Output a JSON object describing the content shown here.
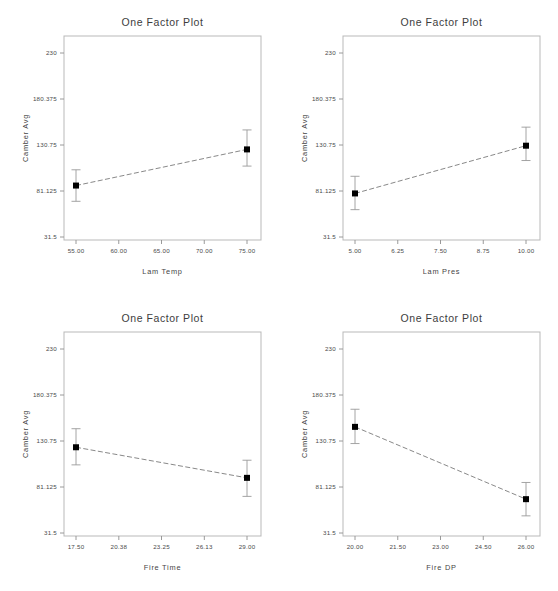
{
  "figure": {
    "background_color": "#ffffff",
    "panel_count": 4,
    "shared_title": "One Factor Plot",
    "shared_ylabel": "Camber Avg",
    "marker_color": "#000000",
    "line_color": "#7a7a7a",
    "frame_color": "#b9b9b9"
  },
  "chart_data": [
    {
      "type": "line",
      "title": "One Factor Plot",
      "xlabel": "Lam Temp",
      "ylabel": "Camber Avg",
      "xlim": [
        55.0,
        75.0
      ],
      "ylim": [
        31.5,
        230.0
      ],
      "xticks": [
        "55.00",
        "60.00",
        "65.00",
        "70.00",
        "75.00"
      ],
      "yticks": [
        "230",
        "180.375",
        "130.75",
        "81.125",
        "31.5"
      ],
      "grid": false,
      "legend": "none",
      "x": [
        55.0,
        75.0
      ],
      "values": [
        87.0,
        126.0
      ],
      "error_low": [
        70.0,
        108.0
      ],
      "error_high": [
        104.0,
        147.0
      ]
    },
    {
      "type": "line",
      "title": "One Factor Plot",
      "xlabel": "Lam Pres",
      "ylabel": "Camber Avg",
      "xlim": [
        5.0,
        10.0
      ],
      "ylim": [
        31.5,
        230.0
      ],
      "xticks": [
        "5.00",
        "6.25",
        "7.50",
        "8.75",
        "10.00"
      ],
      "yticks": [
        "230",
        "180.375",
        "130.75",
        "81.125",
        "31.5"
      ],
      "grid": false,
      "legend": "none",
      "x": [
        5.0,
        10.0
      ],
      "values": [
        78.5,
        130.0
      ],
      "error_low": [
        61.0,
        114.0
      ],
      "error_high": [
        97.0,
        150.0
      ]
    },
    {
      "type": "line",
      "title": "One Factor Plot",
      "xlabel": "Fire Time",
      "ylabel": "Camber Avg",
      "xlim": [
        17.5,
        29.0
      ],
      "ylim": [
        31.5,
        230.0
      ],
      "xticks": [
        "17.50",
        "20.38",
        "23.25",
        "26.13",
        "29.00"
      ],
      "yticks": [
        "230",
        "180.375",
        "130.75",
        "81.125",
        "31.5"
      ],
      "grid": false,
      "legend": "none",
      "x": [
        17.5,
        29.0
      ],
      "values": [
        124.0,
        91.0
      ],
      "error_low": [
        105.0,
        71.0
      ],
      "error_high": [
        144.0,
        110.0
      ]
    },
    {
      "type": "line",
      "title": "One Factor Plot",
      "xlabel": "Fire DP",
      "ylabel": "Camber Avg",
      "xlim": [
        20.0,
        26.0
      ],
      "ylim": [
        31.5,
        230.0
      ],
      "xticks": [
        "20.00",
        "21.50",
        "23.00",
        "24.50",
        "26.00"
      ],
      "yticks": [
        "230",
        "180.375",
        "130.75",
        "81.125",
        "31.5"
      ],
      "grid": false,
      "legend": "none",
      "x": [
        20.0,
        26.0
      ],
      "values": [
        146.0,
        68.0
      ],
      "error_low": [
        128.0,
        50.0
      ],
      "error_high": [
        165.0,
        86.0
      ]
    }
  ]
}
